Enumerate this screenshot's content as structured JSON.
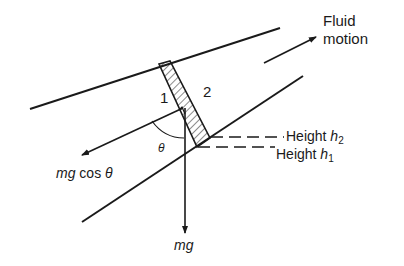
{
  "figure": {
    "type": "physics-diagram",
    "colors": {
      "ink": "#1a1a1a",
      "background": "#ffffff"
    }
  },
  "labels": {
    "fluid_motion_line1": "Fluid",
    "fluid_motion_line2": "motion",
    "section_1": "1",
    "section_2": "2",
    "height_h2_text": "Height ",
    "height_h2_var": "h",
    "height_h2_sub": "2",
    "height_h1_text": "Height ",
    "height_h1_var": "h",
    "height_h1_sub": "1",
    "theta": "θ",
    "mg_cos_theta_mg": "mg",
    "mg_cos_theta_cos": " cos ",
    "mg_cos_theta_theta": "θ",
    "mg": "mg"
  }
}
